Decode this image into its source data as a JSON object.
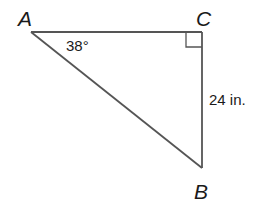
{
  "diagram": {
    "type": "right-triangle",
    "colors": {
      "stroke": "#555555",
      "text": "#1a1a1a",
      "background": "#ffffff"
    },
    "vertices": {
      "A": {
        "label": "A",
        "x": 31,
        "y": 32
      },
      "B": {
        "label": "B",
        "x": 202,
        "y": 168
      },
      "C": {
        "label": "C",
        "x": 202,
        "y": 32
      }
    },
    "angle_A": {
      "label": "38°"
    },
    "right_angle_at": "C",
    "side_CB": {
      "label": "24 in."
    }
  }
}
